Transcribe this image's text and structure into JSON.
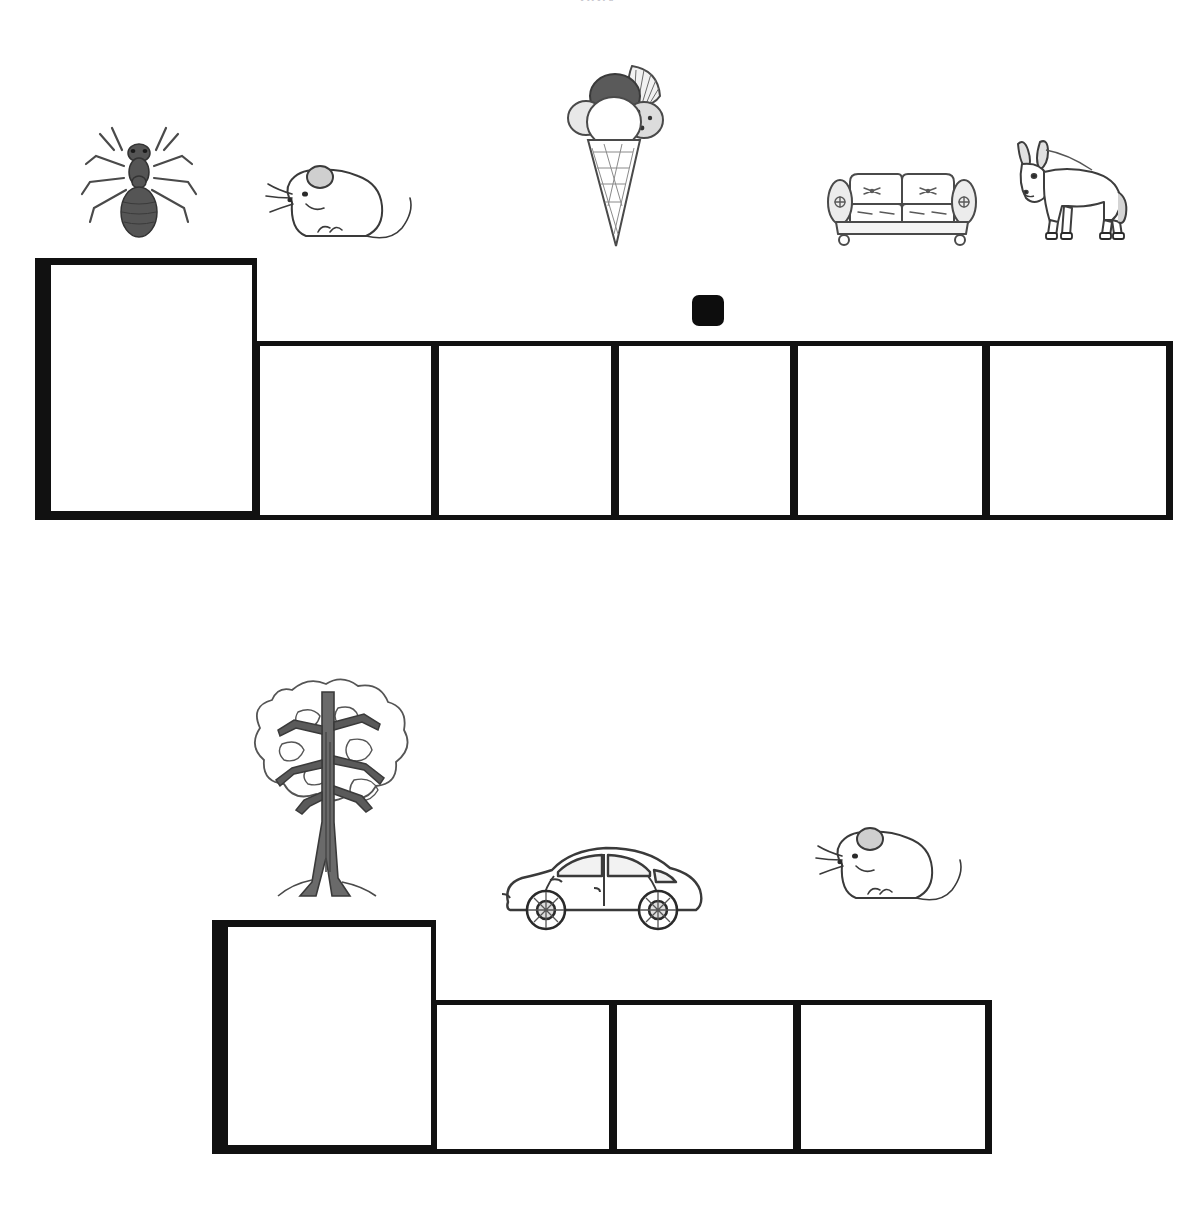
{
  "page": {
    "title_cut_off": "pgjy",
    "background": "#ffffff",
    "ink": "#111111",
    "width": 1196,
    "height": 1229
  },
  "rows": [
    {
      "id": "row-1",
      "pictures": [
        {
          "name": "ant",
          "label": "ant",
          "x": 78,
          "y": 120,
          "w": 122,
          "h": 128
        },
        {
          "name": "mouse",
          "label": "mouse",
          "x": 262,
          "y": 150,
          "w": 160,
          "h": 108
        },
        {
          "name": "ice-cream",
          "label": "ice cream cone",
          "x": 560,
          "y": 56,
          "w": 124,
          "h": 200
        },
        {
          "name": "couch",
          "label": "couch",
          "x": 824,
          "y": 164,
          "w": 156,
          "h": 84
        },
        {
          "name": "donkey",
          "label": "donkey",
          "x": 1000,
          "y": 136,
          "w": 134,
          "h": 112
        }
      ],
      "marker": {
        "name": "black-square-marker",
        "x": 692,
        "y": 295,
        "w": 32,
        "h": 31
      },
      "boxes": [
        {
          "index": 1,
          "x": 35,
          "y": 258,
          "w": 222,
          "h": 262,
          "lead": true,
          "tail": false
        },
        {
          "index": 2,
          "x": 255,
          "y": 341,
          "w": 181,
          "h": 179,
          "lead": false,
          "tail": false
        },
        {
          "index": 3,
          "x": 434,
          "y": 341,
          "w": 182,
          "h": 179,
          "lead": false,
          "tail": false
        },
        {
          "index": 4,
          "x": 614,
          "y": 341,
          "w": 181,
          "h": 179,
          "lead": false,
          "tail": false
        },
        {
          "index": 5,
          "x": 793,
          "y": 341,
          "w": 194,
          "h": 179,
          "lead": false,
          "tail": false
        },
        {
          "index": 6,
          "x": 985,
          "y": 341,
          "w": 188,
          "h": 179,
          "lead": false,
          "tail": true
        }
      ]
    },
    {
      "id": "row-2",
      "pictures": [
        {
          "name": "tree",
          "label": "tree",
          "x": 238,
          "y": 672,
          "w": 182,
          "h": 232
        },
        {
          "name": "car",
          "label": "car",
          "x": 498,
          "y": 840,
          "w": 212,
          "h": 92
        },
        {
          "name": "mouse",
          "label": "mouse",
          "x": 812,
          "y": 812,
          "w": 160,
          "h": 108
        }
      ],
      "boxes": [
        {
          "index": 1,
          "x": 212,
          "y": 920,
          "w": 224,
          "h": 234,
          "lead": true,
          "tail": false
        },
        {
          "index": 2,
          "x": 432,
          "y": 1000,
          "w": 182,
          "h": 154,
          "lead": false,
          "tail": false
        },
        {
          "index": 3,
          "x": 612,
          "y": 1000,
          "w": 186,
          "h": 154,
          "lead": false,
          "tail": false
        },
        {
          "index": 4,
          "x": 796,
          "y": 1000,
          "w": 196,
          "h": 154,
          "lead": false,
          "tail": true
        }
      ]
    }
  ]
}
